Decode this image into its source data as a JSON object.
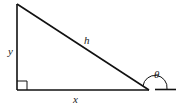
{
  "diagram": {
    "type": "right-triangle",
    "labels": {
      "hypotenuse": "h",
      "vertical_side": "y",
      "horizontal_side": "x",
      "angle": "θ"
    },
    "right_angle_marker": true,
    "line_color": "#111111"
  }
}
